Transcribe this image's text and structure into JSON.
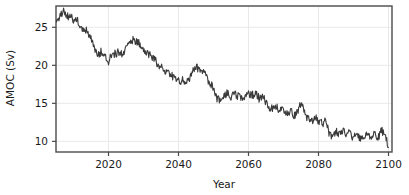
{
  "chart_data": {
    "type": "line",
    "title": "",
    "xlabel": "Year",
    "ylabel": "AMOC (Sv)",
    "xlim": [
      2005,
      2101
    ],
    "ylim": [
      8.6,
      27.8
    ],
    "xticks": [
      2020,
      2040,
      2060,
      2080,
      2100
    ],
    "yticks": [
      10,
      15,
      20,
      25
    ],
    "xtick_labels": [
      "2020",
      "2040",
      "2060",
      "2080",
      "2100"
    ],
    "ytick_labels": [
      "10",
      "15",
      "20",
      "25"
    ],
    "grid": true,
    "legend": "none",
    "line_color": "#3a3a3a",
    "line_width": 1.1,
    "frame_color": "#4a4a4a",
    "grid_color": "#e9e9e9",
    "background": "#ffffff",
    "series": [
      {
        "name": "AMOC",
        "units": "Sv",
        "x": [
          2005,
          2006,
          2007,
          2008,
          2009,
          2010,
          2011,
          2012,
          2013,
          2014,
          2015,
          2016,
          2017,
          2018,
          2019,
          2020,
          2021,
          2022,
          2023,
          2024,
          2025,
          2026,
          2027,
          2028,
          2029,
          2030,
          2031,
          2032,
          2033,
          2034,
          2035,
          2036,
          2037,
          2038,
          2039,
          2040,
          2041,
          2042,
          2043,
          2044,
          2045,
          2046,
          2047,
          2048,
          2049,
          2050,
          2051,
          2052,
          2053,
          2054,
          2055,
          2056,
          2057,
          2058,
          2059,
          2060,
          2061,
          2062,
          2063,
          2064,
          2065,
          2066,
          2067,
          2068,
          2069,
          2070,
          2071,
          2072,
          2073,
          2074,
          2075,
          2076,
          2077,
          2078,
          2079,
          2080,
          2081,
          2082,
          2083,
          2084,
          2085,
          2086,
          2087,
          2088,
          2089,
          2090,
          2091,
          2092,
          2093,
          2094,
          2095,
          2096,
          2097,
          2098,
          2099,
          2100
        ],
        "values": [
          26.1,
          26.4,
          27.2,
          26.3,
          26.6,
          25.8,
          26.0,
          25.2,
          24.8,
          24.4,
          23.6,
          22.4,
          21.3,
          21.8,
          21.4,
          20.6,
          21.6,
          21.5,
          21.8,
          21.3,
          22.2,
          22.9,
          23.4,
          23.1,
          22.9,
          22.3,
          21.6,
          21.3,
          20.9,
          20.2,
          19.7,
          19.3,
          18.9,
          18.6,
          18.2,
          17.9,
          18.1,
          17.7,
          18.2,
          19.1,
          19.9,
          19.4,
          19.3,
          18.4,
          17.7,
          16.9,
          15.7,
          15.4,
          16.1,
          16.3,
          15.9,
          16.2,
          16.0,
          15.6,
          15.9,
          16.4,
          16.1,
          16.3,
          15.7,
          16.0,
          15.0,
          14.4,
          14.2,
          14.6,
          13.9,
          14.3,
          13.6,
          14.0,
          13.4,
          13.8,
          15.2,
          13.6,
          13.0,
          12.6,
          13.2,
          12.8,
          12.4,
          12.6,
          11.1,
          10.7,
          11.3,
          11.0,
          11.4,
          10.8,
          11.1,
          10.4,
          10.9,
          10.3,
          10.8,
          11.2,
          10.6,
          11.0,
          10.5,
          11.4,
          10.9,
          9.2
        ],
        "monthly_noise_amplitude": 0.55
      }
    ]
  }
}
